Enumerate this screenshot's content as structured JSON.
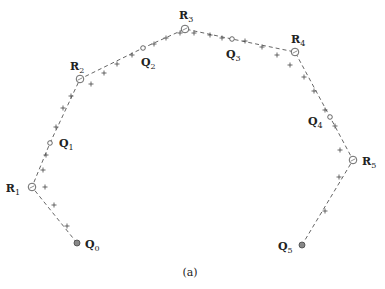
{
  "figure": {
    "caption": "(a)",
    "colors": {
      "line": "#555555",
      "text": "#222222",
      "endpoint_fill": "#888888"
    }
  },
  "points": [
    {
      "id": "Q0",
      "letter": "Q",
      "index": "0",
      "x": 77,
      "y": 243,
      "kind": "endpoint",
      "label_dx": 8,
      "label_dy": 5,
      "anchor": "start"
    },
    {
      "id": "R1",
      "letter": "R",
      "index": "1",
      "x": 32,
      "y": 187,
      "kind": "vertex",
      "label_dx": -12,
      "label_dy": 5,
      "anchor": "end"
    },
    {
      "id": "Q1",
      "letter": "Q",
      "index": "1",
      "x": 50,
      "y": 143,
      "kind": "mid",
      "label_dx": 9,
      "label_dy": 4,
      "anchor": "start"
    },
    {
      "id": "R2",
      "letter": "R",
      "index": "2",
      "x": 80,
      "y": 79,
      "kind": "vertex",
      "label_dx": -10,
      "label_dy": -9,
      "anchor": "start"
    },
    {
      "id": "Q2",
      "letter": "Q",
      "index": "2",
      "x": 143,
      "y": 48,
      "kind": "mid",
      "label_dx": -2,
      "label_dy": 18,
      "anchor": "start"
    },
    {
      "id": "R3",
      "letter": "R",
      "index": "3",
      "x": 185,
      "y": 29,
      "kind": "vertex",
      "label_dx": -6,
      "label_dy": -10,
      "anchor": "start"
    },
    {
      "id": "Q3",
      "letter": "Q",
      "index": "3",
      "x": 232,
      "y": 39,
      "kind": "mid",
      "label_dx": -6,
      "label_dy": 19,
      "anchor": "start"
    },
    {
      "id": "R4",
      "letter": "R",
      "index": "4",
      "x": 295,
      "y": 52,
      "kind": "vertex",
      "label_dx": -4,
      "label_dy": -9,
      "anchor": "start"
    },
    {
      "id": "Q4",
      "letter": "Q",
      "index": "4",
      "x": 330,
      "y": 117,
      "kind": "mid",
      "label_dx": -22,
      "label_dy": 8,
      "anchor": "start"
    },
    {
      "id": "R5",
      "letter": "R",
      "index": "5",
      "x": 353,
      "y": 160,
      "kind": "vertex",
      "label_dx": 9,
      "label_dy": 5,
      "anchor": "start"
    },
    {
      "id": "Q5",
      "letter": "Q",
      "index": "5",
      "x": 302,
      "y": 245,
      "kind": "endpoint",
      "label_dx": -24,
      "label_dy": 5,
      "anchor": "start"
    }
  ],
  "plus_marks": [
    [
      67,
      226
    ],
    [
      54,
      205
    ],
    [
      45,
      187
    ],
    [
      43,
      170
    ],
    [
      46,
      155
    ],
    [
      56,
      127
    ],
    [
      63,
      108
    ],
    [
      71,
      96
    ],
    [
      91,
      84
    ],
    [
      104,
      73
    ],
    [
      117,
      64
    ],
    [
      132,
      55
    ],
    [
      154,
      44
    ],
    [
      166,
      38
    ],
    [
      180,
      33
    ],
    [
      194,
      33
    ],
    [
      210,
      35
    ],
    [
      222,
      38
    ],
    [
      245,
      41
    ],
    [
      262,
      47
    ],
    [
      277,
      55
    ],
    [
      290,
      65
    ],
    [
      304,
      77
    ],
    [
      314,
      91
    ],
    [
      325,
      110
    ],
    [
      335,
      126
    ],
    [
      340,
      150
    ],
    [
      339,
      177
    ],
    [
      325,
      211
    ]
  ]
}
